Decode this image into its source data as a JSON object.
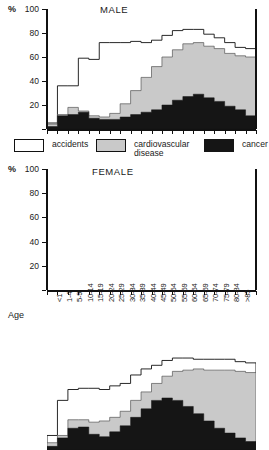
{
  "chart_data": {
    "type": "area",
    "ylabel": "%",
    "xlabel": "Age",
    "ylim": [
      0,
      100
    ],
    "yticks": [
      0,
      20,
      40,
      60,
      80,
      100
    ],
    "ytick_labels": [
      "0",
      "20",
      "40",
      "60",
      "80",
      "100"
    ],
    "grid": false,
    "legend_position": "between-panels",
    "stacking": "cumulative-percent",
    "categories": [
      "<1",
      "1-4",
      "5-9",
      "10-14",
      "15-19",
      "20-24",
      "25-29",
      "30-34",
      "35-39",
      "40-44",
      "45-49",
      "50-54",
      "55-59",
      "60-64",
      "65-69",
      "70-74",
      "75-79",
      "80-84",
      ">85"
    ],
    "panels": [
      {
        "name": "male",
        "title": "MALE",
        "series": [
          {
            "name": "cancer",
            "color": "#151515",
            "values": [
              2,
              11,
              12,
              14,
              9,
              8,
              8,
              10,
              12,
              14,
              16,
              20,
              24,
              27,
              29,
              26,
              23,
              19,
              16,
              11
            ]
          },
          {
            "name": "cardiovascular disease",
            "color": "#c9c9c9",
            "values": [
              2,
              1,
              6,
              1,
              2,
              2,
              5,
              11,
              20,
              29,
              36,
              40,
              42,
              44,
              43,
              43,
              44,
              44,
              45,
              49
            ]
          },
          {
            "name": "accidents",
            "color": "#ffffff",
            "values": [
              1,
              24,
              18,
              44,
              47,
              62,
              59,
              51,
              41,
              29,
              22,
              18,
              16,
              12,
              11,
              10,
              9,
              9,
              7,
              7
            ]
          }
        ],
        "cumulative": {
          "cancer_top": [
            2,
            11,
            12,
            14,
            9,
            8,
            8,
            10,
            12,
            14,
            16,
            20,
            24,
            27,
            29,
            26,
            23,
            19,
            16,
            11
          ],
          "cvd_top": [
            4,
            12,
            18,
            15,
            11,
            10,
            13,
            21,
            32,
            43,
            52,
            60,
            66,
            71,
            72,
            69,
            67,
            63,
            61,
            60
          ],
          "accidents_top": [
            5,
            36,
            36,
            59,
            58,
            72,
            72,
            72,
            73,
            72,
            74,
            78,
            82,
            83,
            83,
            79,
            76,
            72,
            68,
            67
          ]
        }
      },
      {
        "name": "female",
        "title": "FEMALE",
        "series": [
          {
            "name": "cancer",
            "color": "#151515",
            "values": [
              3,
              10,
              18,
              19,
              13,
              11,
              15,
              20,
              27,
              34,
              41,
              43,
              41,
              36,
              30,
              24,
              18,
              14,
              10,
              7
            ]
          },
          {
            "name": "cardiovascular disease",
            "color": "#c9c9c9",
            "values": [
              3,
              2,
              7,
              6,
              10,
              13,
              12,
              12,
              14,
              14,
              14,
              18,
              24,
              30,
              37,
              42,
              48,
              52,
              55,
              57
            ]
          },
          {
            "name": "accidents",
            "color": "#ffffff",
            "values": [
              6,
              29,
              25,
              26,
              28,
              26,
              26,
              23,
              21,
              19,
              15,
              13,
              11,
              10,
              8,
              9,
              9,
              9,
              8,
              8
            ]
          }
        ],
        "cumulative": {
          "cancer_top": [
            3,
            10,
            18,
            19,
            13,
            11,
            15,
            20,
            27,
            34,
            41,
            43,
            41,
            36,
            30,
            24,
            18,
            14,
            10,
            7
          ],
          "cvd_top": [
            6,
            12,
            25,
            25,
            23,
            24,
            27,
            32,
            41,
            48,
            55,
            61,
            65,
            66,
            67,
            66,
            66,
            66,
            65,
            64
          ],
          "accidents_top": [
            12,
            41,
            50,
            51,
            51,
            50,
            53,
            55,
            62,
            67,
            70,
            74,
            76,
            76,
            75,
            75,
            75,
            75,
            73,
            72
          ]
        }
      }
    ]
  },
  "axis": {
    "percent_symbol": "%",
    "age_label": "Age"
  },
  "legend": {
    "items": [
      {
        "key": "accidents",
        "label": "accidents",
        "color": "#ffffff"
      },
      {
        "key": "cvd",
        "label": "cardiovascular\ndisease",
        "color": "#c9c9c9"
      },
      {
        "key": "cancer",
        "label": "cancer",
        "color": "#151515"
      }
    ]
  }
}
